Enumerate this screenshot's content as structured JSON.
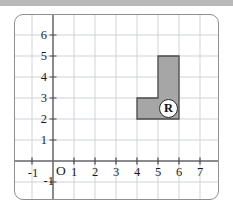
{
  "figure": {
    "title_bar_color": "#b9b9b9",
    "background": "#ffffff",
    "frame_border_color": "#8f8f93"
  },
  "chart_data": {
    "type": "scatter",
    "title": "",
    "xlabel": "",
    "ylabel": "",
    "grid": true,
    "legend": "none",
    "xlim": [
      -1.6,
      7.9
    ],
    "ylim": [
      -1.6,
      6.9
    ],
    "x_ticks": [
      -1,
      1,
      2,
      3,
      4,
      5,
      6,
      7
    ],
    "y_ticks": [
      -1,
      1,
      2,
      3,
      4,
      5,
      6
    ],
    "x_tick_labels": [
      "-1",
      "1",
      "2",
      "3",
      "4",
      "5",
      "6",
      "7"
    ],
    "y_tick_labels": [
      "-1",
      "1",
      "2",
      "3",
      "4",
      "5",
      "6"
    ],
    "origin_label": "O",
    "grid_color": "#c9cfd6",
    "axis_color": "#6b6b6f",
    "shapes": [
      {
        "name": "R",
        "label": "R",
        "kind": "polygon",
        "fill": "#a6a6a6",
        "stroke": "#4a4a4a",
        "vertices": [
          [
            4,
            2
          ],
          [
            6,
            2
          ],
          [
            6,
            5
          ],
          [
            5,
            5
          ],
          [
            5,
            3
          ],
          [
            4,
            3
          ]
        ],
        "label_position": [
          5.5,
          2.5
        ]
      }
    ]
  },
  "labels": {
    "y": [
      {
        "text": "6",
        "value": 6
      },
      {
        "text": "5",
        "value": 5
      },
      {
        "text": "4",
        "value": 4
      },
      {
        "text": "3",
        "value": 3
      },
      {
        "text": "2",
        "value": 2
      },
      {
        "text": "1",
        "value": 1
      },
      {
        "text": "-1",
        "value": -1
      }
    ],
    "x": [
      {
        "text": "-1",
        "value": -1
      },
      {
        "text": "1",
        "value": 1
      },
      {
        "text": "2",
        "value": 2
      },
      {
        "text": "3",
        "value": 3
      },
      {
        "text": "4",
        "value": 4
      },
      {
        "text": "5",
        "value": 5
      },
      {
        "text": "6",
        "value": 6
      },
      {
        "text": "7",
        "value": 7
      }
    ],
    "origin": "O",
    "shape_r": "R"
  }
}
